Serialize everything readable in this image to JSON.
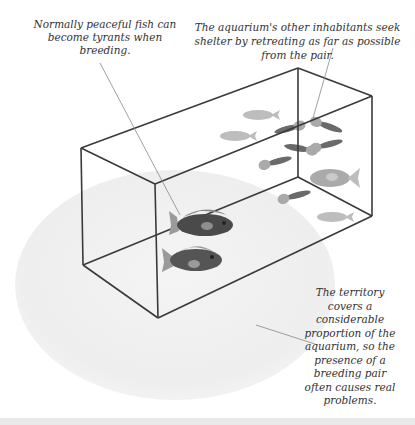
{
  "diagram": {
    "captions": [
      {
        "id": "peaceful-fish",
        "text": "Normally peaceful fish can become tyrants when breeding."
      },
      {
        "id": "inhabitants-shelter",
        "text": "The aquarium's other inhabitants seek shelter by retreating as far as possible from the pair."
      },
      {
        "id": "territory",
        "text": "The territory covers a considerable proportion of the aquarium, so the presence of a breeding pair often causes real problems."
      }
    ],
    "elements": {
      "territory_zone": "Shaded elliptical territory area",
      "aquarium": "Wireframe glass tank",
      "breeding_pair": "Two dark cichlids in front left of tank",
      "other_fish": "Lighter fish crowded at the back right of tank"
    },
    "colors": {
      "tank_line": "#3a3a3a",
      "territory": "#efefef",
      "breeding_fish": "#4a4a4a",
      "breeding_fish_fin": "#9a9a9a",
      "other_fish": "#b8b8b8",
      "leader_line": "#888888"
    }
  }
}
